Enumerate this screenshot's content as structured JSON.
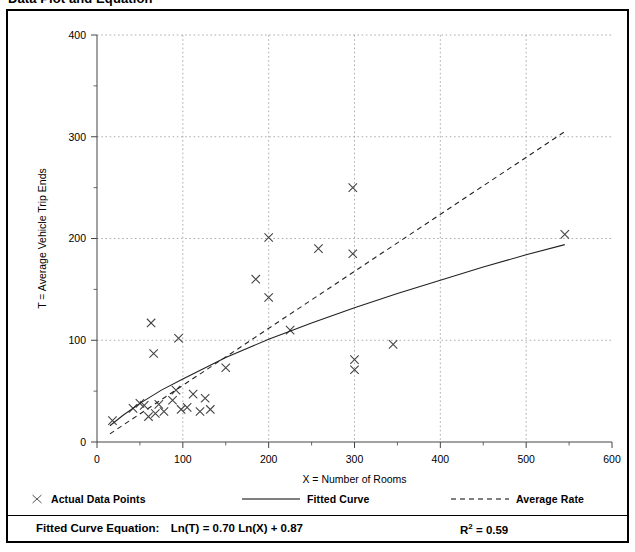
{
  "figure": {
    "title": "Data Plot and Equation"
  },
  "legend": {
    "entries": [
      {
        "label": "Actual Data Points",
        "symbol": "x-marker"
      },
      {
        "label": "Fitted Curve",
        "symbol": "solid-line"
      },
      {
        "label": "Average Rate",
        "symbol": "dashed-line"
      }
    ]
  },
  "footer": {
    "equation_prefix": "Fitted Curve Equation:",
    "equation": "Ln(T) = 0.70 Ln(X) + 0.87",
    "rsquared_label": "R",
    "rsquared_exponent": "2",
    "rsquared_value": "= 0.59"
  },
  "chart_data": {
    "type": "scatter",
    "title": "Data Plot and Equation",
    "xlabel": "X = Number of Rooms",
    "ylabel": "T = Average Vehicle Trip Ends",
    "xlim": [
      0,
      600
    ],
    "ylim": [
      0,
      400
    ],
    "xticks": [
      0,
      100,
      200,
      300,
      400,
      500,
      600
    ],
    "yticks": [
      0,
      100,
      200,
      300,
      400
    ],
    "xminorticks": [
      50,
      150,
      250,
      350,
      450,
      550
    ],
    "yminorticks": [
      50,
      150,
      250,
      350
    ],
    "grid": "dotted-major-both",
    "legend_position": "below-plot",
    "series": [
      {
        "name": "Actual Data Points",
        "type": "scatter",
        "marker": "x",
        "points": [
          [
            18,
            21
          ],
          [
            42,
            33
          ],
          [
            50,
            38
          ],
          [
            55,
            36
          ],
          [
            60,
            25
          ],
          [
            63,
            117
          ],
          [
            66,
            87
          ],
          [
            68,
            28
          ],
          [
            72,
            37
          ],
          [
            78,
            30
          ],
          [
            88,
            41
          ],
          [
            92,
            51
          ],
          [
            95,
            102
          ],
          [
            98,
            32
          ],
          [
            105,
            34
          ],
          [
            112,
            47
          ],
          [
            120,
            30
          ],
          [
            126,
            43
          ],
          [
            132,
            32
          ],
          [
            150,
            73
          ],
          [
            185,
            160
          ],
          [
            200,
            201
          ],
          [
            200,
            142
          ],
          [
            225,
            110
          ],
          [
            258,
            190
          ],
          [
            298,
            185
          ],
          [
            298,
            250
          ],
          [
            300,
            81
          ],
          [
            300,
            71
          ],
          [
            345,
            96
          ],
          [
            545,
            204
          ]
        ]
      },
      {
        "name": "Fitted Curve",
        "type": "line",
        "style": "solid",
        "equation": "Ln(T) = 0.70 Ln(X) + 0.87",
        "rsquared": 0.59,
        "points": [
          [
            15,
            16
          ],
          [
            30,
            26
          ],
          [
            50,
            38
          ],
          [
            75,
            51
          ],
          [
            100,
            62
          ],
          [
            150,
            83
          ],
          [
            200,
            101
          ],
          [
            250,
            117
          ],
          [
            300,
            132
          ],
          [
            350,
            146
          ],
          [
            400,
            159
          ],
          [
            450,
            172
          ],
          [
            500,
            184
          ],
          [
            545,
            194
          ]
        ]
      },
      {
        "name": "Average Rate",
        "type": "line",
        "style": "dashed",
        "points": [
          [
            15,
            8
          ],
          [
            545,
            305
          ]
        ]
      }
    ]
  }
}
